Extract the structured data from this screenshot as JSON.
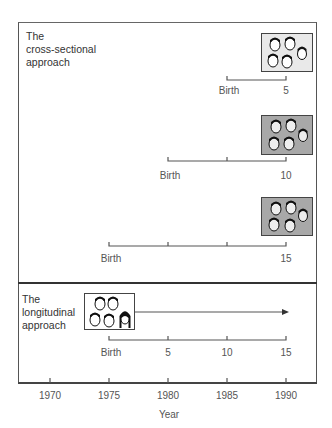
{
  "figure": {
    "cross_sectional": {
      "title": "The\ncross-sectional\napproach",
      "cohorts": [
        {
          "age": 5,
          "start_label": "Birth",
          "end_label": "5",
          "photo_style": "light"
        },
        {
          "age": 10,
          "start_label": "Birth",
          "end_label": "10",
          "photo_style": "gray"
        },
        {
          "age": 15,
          "start_label": "Birth",
          "end_label": "15",
          "photo_style": "gray"
        }
      ]
    },
    "longitudinal": {
      "title": "The\nlongitudinal\napproach",
      "age_labels": [
        "Birth",
        "5",
        "10",
        "15"
      ],
      "photo_style": "white"
    },
    "x_axis": {
      "label": "Year",
      "ticks": [
        "1970",
        "1975",
        "1980",
        "1985",
        "1990"
      ]
    }
  },
  "colors": {
    "line": "#444444",
    "photo_gray": "#a8a8a8",
    "photo_light": "#e9e9e9",
    "text": "#555555"
  }
}
